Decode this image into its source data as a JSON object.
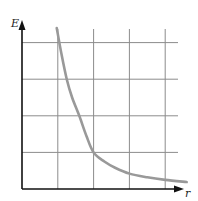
{
  "chart_data": {
    "type": "line",
    "title": "",
    "xlabel": "r",
    "ylabel": "E",
    "xlim": [
      0,
      4.6
    ],
    "ylim": [
      0,
      4.6
    ],
    "grid": true,
    "grid_x": [
      1,
      2,
      3,
      4
    ],
    "grid_y": [
      1,
      2,
      3,
      4
    ],
    "tick_labels_shown": false,
    "legend": null,
    "series": [
      {
        "name": "E(r)",
        "color": "#999999",
        "x": [
          0.97,
          1.1,
          1.25,
          1.4,
          1.6,
          1.8,
          2.0,
          2.3,
          2.6,
          3.0,
          3.5,
          4.0,
          4.6
        ],
        "y": [
          4.4,
          3.7,
          3.0,
          2.5,
          2.0,
          1.45,
          1.0,
          0.75,
          0.58,
          0.42,
          0.32,
          0.25,
          0.19
        ]
      }
    ]
  },
  "colors": {
    "axis": "#111111",
    "grid": "#8c8c8c",
    "curve": "#999999"
  }
}
